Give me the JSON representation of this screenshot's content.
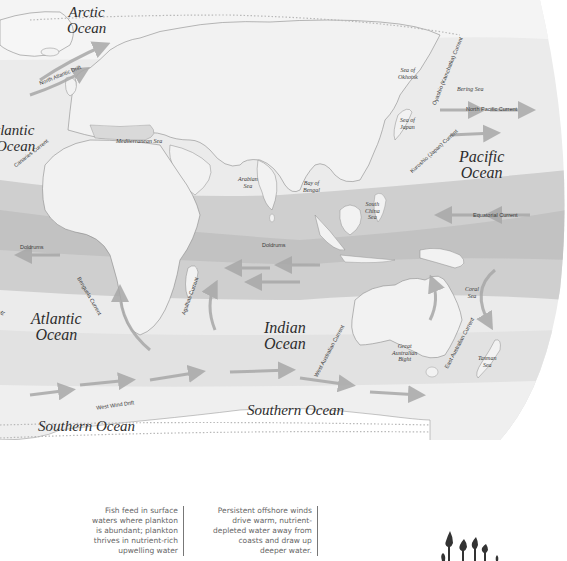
{
  "map": {
    "title": "World Ocean Currents",
    "colors": {
      "land": "#f2f2f2",
      "ocean_light": "#e6e6e6",
      "ocean_mid": "#d2d2d2",
      "ocean_dark": "#bdbdbd",
      "arrow": "#a8a8a8",
      "coast": "#8a8a8a"
    },
    "oceans": [
      {
        "id": "arctic",
        "line1": "Arctic",
        "line2": "Ocean"
      },
      {
        "id": "atlantic-north",
        "line1": "tlantic",
        "line2": "Ocean"
      },
      {
        "id": "pacific",
        "line1": "Pacific",
        "line2": "Ocean"
      },
      {
        "id": "atlantic-south",
        "line1": "Atlantic",
        "line2": "Ocean"
      },
      {
        "id": "indian",
        "line1": "Indian",
        "line2": "Ocean"
      },
      {
        "id": "southern-1",
        "line1": "Southern Ocean"
      },
      {
        "id": "southern-2",
        "line1": "Southern Ocean"
      }
    ],
    "seas": [
      {
        "id": "mediterranean",
        "line1": "Mediterranean Sea"
      },
      {
        "id": "arabian",
        "line1": "Arabian",
        "line2": "Sea"
      },
      {
        "id": "bengal",
        "line1": "Bay of",
        "line2": "Bengal"
      },
      {
        "id": "south-china",
        "line1": "South",
        "line2": "China",
        "line3": "Sea"
      },
      {
        "id": "okhotsk",
        "line1": "Sea of",
        "line2": "Okhotsk"
      },
      {
        "id": "japan",
        "line1": "Sea of",
        "line2": "Japan"
      },
      {
        "id": "bering",
        "line1": "Bering Sea"
      },
      {
        "id": "coral",
        "line1": "Coral",
        "line2": "Sea"
      },
      {
        "id": "tasman",
        "line1": "Tasman",
        "line2": "Sea"
      },
      {
        "id": "great-australian-bight",
        "line1": "Great",
        "line2": "Australian",
        "line3": "Bight"
      }
    ],
    "currents": [
      {
        "id": "north-atlantic-drift",
        "label": "North Atlantic Drift"
      },
      {
        "id": "canaries",
        "label": "Canaries Current"
      },
      {
        "id": "doldrums-atlantic",
        "label": "Doldrums"
      },
      {
        "id": "benguela",
        "label": "Benguela Current"
      },
      {
        "id": "agulhas",
        "label": "Agulhas Current"
      },
      {
        "id": "doldrums-indian",
        "label": "Doldrums"
      },
      {
        "id": "west-australian",
        "label": "West Australian Current"
      },
      {
        "id": "east-australian",
        "label": "East Australian Current"
      },
      {
        "id": "west-wind-drift",
        "label": "West Wind Drift"
      },
      {
        "id": "oyashio",
        "label": "Oyashio (Kamchatka) Current"
      },
      {
        "id": "kuroshio",
        "label": "Kuroshio (Japan) Current"
      },
      {
        "id": "north-pacific",
        "label": "North Pacific Current"
      },
      {
        "id": "equatorial",
        "label": "Equatorial Current"
      },
      {
        "id": "partial-left",
        "label": "ift"
      }
    ]
  },
  "captions": [
    {
      "id": "fish-feed",
      "lines": [
        "Fish feed in surface",
        "waters where plankton",
        "is abundant; plankton",
        "thrives in nutrient-rich",
        "upwelling water"
      ]
    },
    {
      "id": "offshore-winds",
      "lines": [
        "Persistent offshore winds",
        "drive warm, nutrient-",
        "depleted water away from",
        "coasts and draw up",
        "deeper water."
      ]
    }
  ]
}
